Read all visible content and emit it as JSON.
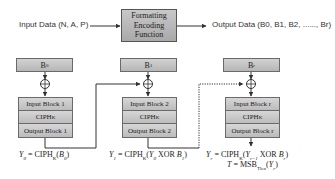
{
  "top": {
    "input_label": "Input Data (N, A, P)",
    "function_box": {
      "line1": "Formatting",
      "line2": "Encoding",
      "line3": "Function"
    },
    "output_label": "Output Data (B0, B1, B2, ......, Br)"
  },
  "columns": [
    {
      "block_label": "B",
      "block_sub": "0",
      "rows": [
        "Input Block 1",
        "CIPH",
        "Output Block 1"
      ],
      "ciph_sub": "K",
      "equation": "Y0 = CIPHK(B0)"
    },
    {
      "block_label": "B",
      "block_sub": "1",
      "rows": [
        "Input Block 2",
        "CIPH",
        "Output Block 2"
      ],
      "ciph_sub": "K",
      "equation": "Y1 = CIPHK(Y0 XOR B1)"
    },
    {
      "block_label": "B",
      "block_sub": "r",
      "rows": [
        "Input Block r",
        "CIPH",
        "Output Block r"
      ],
      "ciph_sub": "K",
      "equation": "Yr = CIPHK(Yr-1 XOR Br)",
      "tag_equation": "T = MSBTlen(Yr)"
    }
  ],
  "colors": {
    "box_fill": "#c4c4c4",
    "line": "#333333",
    "text": "#222222"
  }
}
